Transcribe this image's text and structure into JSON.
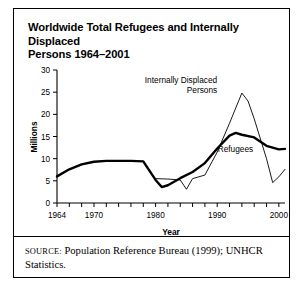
{
  "figure": {
    "title": "Worldwide Total Refugees and Internally Displaced Persons 1964–2001",
    "title_line1": "Worldwide Total Refugees and Internally Displaced",
    "title_line2": "Persons 1964–2001",
    "source_prefix": "SOURCE:",
    "source_text": " Population Reference Bureau (1999); UNHCR Statistics.",
    "border_color": "#000000",
    "background_color": "#ffffff"
  },
  "chart_data": {
    "type": "line",
    "title": "Worldwide Total Refugees and Internally Displaced Persons 1964–2001",
    "xlabel": "Year",
    "ylabel": "Millions",
    "xlim": [
      1964,
      2001
    ],
    "ylim": [
      0,
      30
    ],
    "yticks": [
      0,
      5,
      10,
      15,
      20,
      25,
      30
    ],
    "ytick_labels": [
      "0",
      "5",
      "10",
      "15",
      "20",
      "25",
      "30"
    ],
    "xticks": [
      1964,
      1966,
      1968,
      1970,
      1972,
      1974,
      1976,
      1978,
      1980,
      1982,
      1984,
      1986,
      1988,
      1990,
      1992,
      1994,
      1996,
      1998,
      2000
    ],
    "xtick_labels_shown": [
      "1964",
      "1970",
      "1980",
      "1990",
      "2000"
    ],
    "xtick_labels_positions": [
      1964,
      1970,
      1980,
      1990,
      2000
    ],
    "grid": false,
    "legend_position": "inline-annotations",
    "series": [
      {
        "name": "Refugees",
        "style": "thick-solid-black",
        "color": "#000000",
        "line_width": 2.4,
        "label_x": 1993,
        "label_y": 11.6,
        "x": [
          1964,
          1966,
          1968,
          1970,
          1972,
          1974,
          1976,
          1978,
          1980,
          1981,
          1982,
          1984,
          1986,
          1988,
          1990,
          1992,
          1993,
          1994,
          1996,
          1998,
          2000,
          2001
        ],
        "values": [
          6.0,
          7.6,
          8.7,
          9.3,
          9.5,
          9.5,
          9.5,
          9.4,
          5.2,
          3.6,
          4.0,
          5.6,
          7.0,
          9.0,
          12.3,
          15.2,
          15.8,
          15.4,
          14.8,
          12.9,
          12.1,
          12.2
        ]
      },
      {
        "name": "Internally Displaced Persons",
        "style": "thin-solid-black",
        "color": "#000000",
        "line_width": 0.9,
        "label_x": 1990,
        "label_y": 27.0,
        "x": [
          1980,
          1982,
          1984,
          1985,
          1986,
          1988,
          1990,
          1992,
          1994,
          1995,
          1996,
          1998,
          1999,
          2000,
          2001
        ],
        "values": [
          5.5,
          5.4,
          5.2,
          3.1,
          5.5,
          6.3,
          11.5,
          18.0,
          24.8,
          23.0,
          19.0,
          10.0,
          4.6,
          5.9,
          7.6
        ]
      }
    ],
    "annotations": [
      {
        "text": "Internally Displaced",
        "line": 1,
        "for": "Internally Displaced Persons"
      },
      {
        "text": "Persons",
        "line": 2,
        "for": "Internally Displaced Persons"
      },
      {
        "text": "Refugees",
        "line": 1,
        "for": "Refugees"
      }
    ]
  }
}
